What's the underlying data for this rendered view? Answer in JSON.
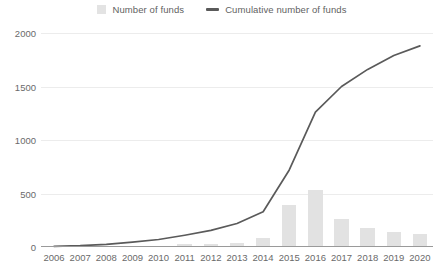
{
  "chart_data": {
    "type": "bar",
    "title": "",
    "xlabel": "",
    "ylabel": "",
    "ylim": [
      0,
      2000
    ],
    "yticks": [
      0,
      500,
      1000,
      1500,
      2000
    ],
    "grid": true,
    "legend_position": "top-center",
    "categories": [
      "2006",
      "2007",
      "2008",
      "2009",
      "2010",
      "2011",
      "2012",
      "2013",
      "2014",
      "2015",
      "2016",
      "2017",
      "2018",
      "2019",
      "2020"
    ],
    "series": [
      {
        "name": "Number of funds",
        "type": "bar",
        "color": "#e2e2e2",
        "values": [
          2,
          3,
          5,
          10,
          14,
          25,
          30,
          40,
          85,
          390,
          530,
          265,
          175,
          145,
          125
        ]
      },
      {
        "name": "Cumulative number of funds",
        "type": "line",
        "color": "#5a5a5a",
        "values": [
          5,
          12,
          25,
          45,
          70,
          110,
          155,
          220,
          330,
          720,
          1260,
          1500,
          1660,
          1790,
          1880
        ]
      }
    ]
  },
  "legend": {
    "items": [
      {
        "label": "Number of funds",
        "marker": "bar-swatch-icon"
      },
      {
        "label": "Cumulative number of funds",
        "marker": "line-swatch-icon"
      }
    ]
  },
  "axes": {
    "y": {
      "ticks": [
        "0",
        "500",
        "1000",
        "1500",
        "2000"
      ]
    },
    "x": {
      "ticks": [
        "2006",
        "2007",
        "2008",
        "2009",
        "2010",
        "2011",
        "2012",
        "2013",
        "2014",
        "2015",
        "2016",
        "2017",
        "2018",
        "2019",
        "2020"
      ]
    }
  },
  "colors": {
    "bar": "#e2e2e2",
    "line": "#5a5a5a",
    "grid": "#ececec",
    "axis": "#9a9a9a",
    "text": "#6a6a6a"
  }
}
